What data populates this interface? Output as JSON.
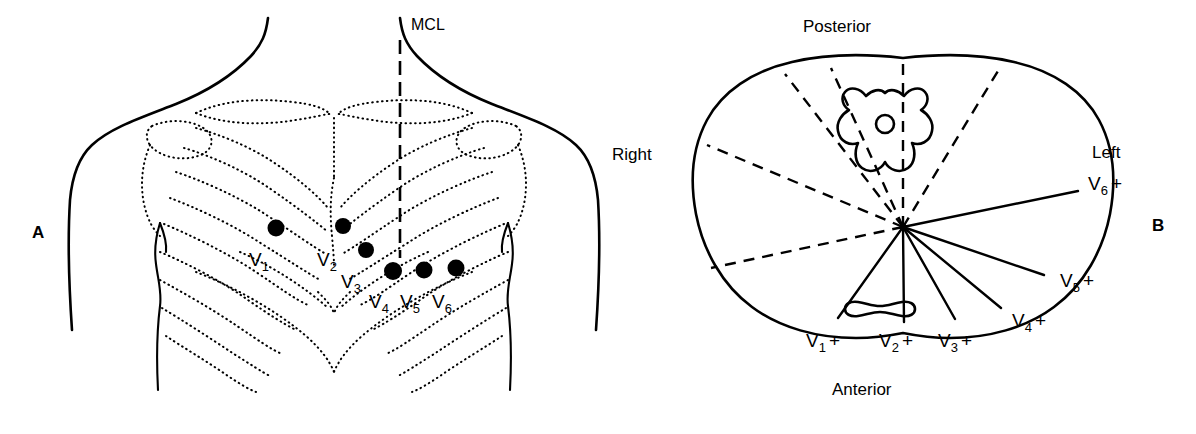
{
  "figure": {
    "panels": [
      {
        "id": "A",
        "letter": "A",
        "description": "Anterior chest wall with ribcage showing V1-V6 electrode positions",
        "midclavicular_line_label": "MCL",
        "electrodes": [
          {
            "label": "V",
            "subscript": "1",
            "x": 276,
            "y": 228,
            "label_x": 249,
            "label_y": 266
          },
          {
            "label": "V",
            "subscript": "2",
            "x": 343,
            "y": 226,
            "label_x": 317,
            "label_y": 266
          },
          {
            "label": "V",
            "subscript": "3",
            "x": 366,
            "y": 250,
            "label_x": 341,
            "label_y": 288
          },
          {
            "label": "V",
            "subscript": "4",
            "x": 393,
            "y": 271,
            "label_x": 369,
            "label_y": 308
          },
          {
            "label": "V",
            "subscript": "5",
            "x": 424,
            "y": 270,
            "label_x": 400,
            "label_y": 308
          },
          {
            "label": "V",
            "subscript": "6",
            "x": 456,
            "y": 268,
            "label_x": 432,
            "label_y": 308
          }
        ]
      },
      {
        "id": "B",
        "letter": "B",
        "description": "Horizontal cross-section of thorax at heart level showing lead axes radiating from the electrical center",
        "orientation_labels": {
          "posterior": "Posterior",
          "anterior": "Anterior",
          "right": "Right",
          "left": "Left"
        },
        "center_point": {
          "x": 903,
          "y": 227
        },
        "leads": [
          {
            "label": "V",
            "subscript": "1",
            "polarity": "+",
            "label_x": 806,
            "label_y": 347,
            "electrode_x": 838,
            "electrode_y": 318
          },
          {
            "label": "V",
            "subscript": "2",
            "polarity": "+",
            "label_x": 879,
            "label_y": 347,
            "electrode_x": 904,
            "electrode_y": 322
          },
          {
            "label": "V",
            "subscript": "3",
            "polarity": "+",
            "label_x": 938,
            "label_y": 347,
            "electrode_x": 955,
            "electrode_y": 319
          },
          {
            "label": "V",
            "subscript": "4",
            "polarity": "+",
            "label_x": 1012,
            "label_y": 327,
            "electrode_x": 1001,
            "electrode_y": 308
          },
          {
            "label": "V",
            "subscript": "5",
            "polarity": "+",
            "label_x": 1060,
            "label_y": 287,
            "electrode_x": 1044,
            "electrode_y": 275
          },
          {
            "label": "V",
            "subscript": "6",
            "polarity": "+",
            "label_x": 1088,
            "label_y": 190,
            "electrode_x": 1078,
            "electrode_y": 191
          }
        ],
        "organs": [
          {
            "name": "vertebra",
            "note": "thoracic vertebra with spinal canal, posterior midline"
          },
          {
            "name": "sternum",
            "note": "sternum cross-section, anterior midline"
          }
        ]
      }
    ]
  },
  "colors": {
    "ink": "#000000",
    "background": "#ffffff"
  }
}
